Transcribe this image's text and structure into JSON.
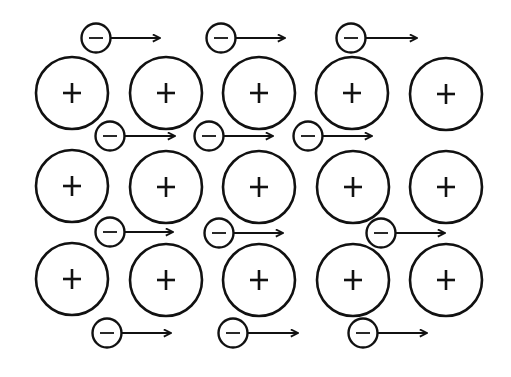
{
  "diagram": {
    "colors": {
      "stroke": "#111111",
      "background": "#ffffff"
    },
    "ion_symbol": "+",
    "electron_symbol": "−",
    "ions": [
      {
        "x": 72,
        "y": 93
      },
      {
        "x": 166,
        "y": 93
      },
      {
        "x": 259,
        "y": 93
      },
      {
        "x": 352,
        "y": 93
      },
      {
        "x": 446,
        "y": 94
      },
      {
        "x": 72,
        "y": 186
      },
      {
        "x": 166,
        "y": 187
      },
      {
        "x": 259,
        "y": 187
      },
      {
        "x": 353,
        "y": 187
      },
      {
        "x": 446,
        "y": 187
      },
      {
        "x": 72,
        "y": 279
      },
      {
        "x": 166,
        "y": 280
      },
      {
        "x": 259,
        "y": 280
      },
      {
        "x": 353,
        "y": 280
      },
      {
        "x": 446,
        "y": 280
      }
    ],
    "electrons": [
      {
        "x": 96,
        "y": 38,
        "arrow_end": 160
      },
      {
        "x": 221,
        "y": 38,
        "arrow_end": 285
      },
      {
        "x": 351,
        "y": 38,
        "arrow_end": 417
      },
      {
        "x": 110,
        "y": 136,
        "arrow_end": 175
      },
      {
        "x": 209,
        "y": 136,
        "arrow_end": 273
      },
      {
        "x": 308,
        "y": 136,
        "arrow_end": 372
      },
      {
        "x": 110,
        "y": 232,
        "arrow_end": 173
      },
      {
        "x": 219,
        "y": 233,
        "arrow_end": 283
      },
      {
        "x": 381,
        "y": 233,
        "arrow_end": 445
      },
      {
        "x": 107,
        "y": 333,
        "arrow_end": 171
      },
      {
        "x": 233,
        "y": 333,
        "arrow_end": 298
      },
      {
        "x": 363,
        "y": 333,
        "arrow_end": 427
      }
    ]
  }
}
